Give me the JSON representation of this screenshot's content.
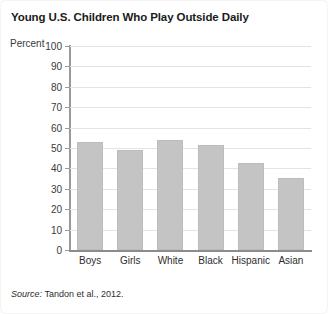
{
  "chart_data": {
    "type": "bar",
    "title": "Young U.S. Children Who Play Outside Daily",
    "xlabel": "",
    "ylabel": "Percent",
    "ylim": [
      0,
      100
    ],
    "ytick_step": 10,
    "yticks": [
      100,
      90,
      80,
      70,
      60,
      50,
      40,
      30,
      20,
      10,
      0
    ],
    "categories": [
      "Boys",
      "Girls",
      "White",
      "Black",
      "Hispanic",
      "Asian"
    ],
    "values": [
      53,
      49,
      54,
      51.5,
      42.5,
      35.5
    ],
    "grid": "horizontal",
    "legend": "none",
    "bar_color": "#c4c4c4",
    "gridline_color": "#e3e3e3",
    "axis_color": "#9a9a9a",
    "source_label": "Source:",
    "source_text": "Tandon et al., 2012."
  },
  "figure": {
    "background": "#ffffff",
    "title_color": "#1b1b1b"
  }
}
